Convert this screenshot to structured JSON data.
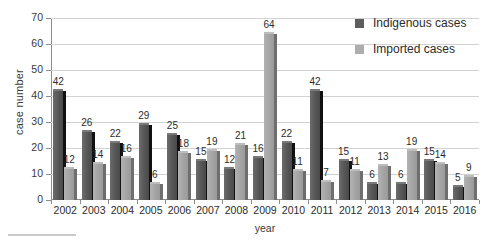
{
  "chart_data": {
    "type": "bar",
    "title": "",
    "xlabel": "year",
    "ylabel": "case number",
    "ylim": [
      0,
      70
    ],
    "yticks": [
      0,
      10,
      20,
      30,
      40,
      50,
      60,
      70
    ],
    "grid": true,
    "legend_position": "top-right",
    "categories": [
      "2002",
      "2003",
      "2004",
      "2005",
      "2006",
      "2007",
      "2008",
      "2009",
      "2010",
      "2011",
      "2012",
      "2013",
      "2014",
      "2015",
      "2016"
    ],
    "series": [
      {
        "name": "Indigenous cases",
        "color": "#5d5d5d",
        "values": [
          42,
          26,
          22,
          29,
          25,
          15,
          12,
          16,
          22,
          42,
          15,
          6,
          6,
          15,
          5
        ]
      },
      {
        "name": "Imported cases",
        "color": "#adadad",
        "values": [
          12,
          14,
          16,
          6,
          18,
          19,
          21,
          64,
          11,
          7,
          11,
          13,
          19,
          14,
          9
        ]
      }
    ]
  },
  "legend": {
    "items": [
      {
        "label": "Indigenous cases",
        "swatch": "dark"
      },
      {
        "label": "Imported cases",
        "swatch": "light"
      }
    ]
  }
}
